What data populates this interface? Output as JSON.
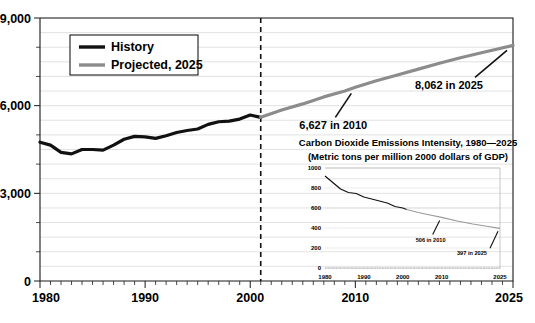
{
  "chart_data": [
    {
      "id": "main",
      "type": "line",
      "title": "",
      "xlabel": "",
      "ylabel": "",
      "xlim": [
        1980,
        2025
      ],
      "ylim": [
        0,
        9000
      ],
      "yticks": [
        0,
        3000,
        6000,
        9000
      ],
      "ytick_labels": [
        "0",
        "3,000",
        "6,000",
        "9,000"
      ],
      "ytick_minor_step": 1000,
      "xticks": [
        1980,
        1990,
        2000,
        2010,
        2025
      ],
      "xtick_labels": [
        "1980",
        "1990",
        "2000",
        "2010",
        "2025"
      ],
      "grid": true,
      "legend_position": "upper-left",
      "divider_year": 2001,
      "series": [
        {
          "name": "History",
          "color": "#111111",
          "x": [
            1980,
            1981,
            1982,
            1983,
            1984,
            1985,
            1986,
            1987,
            1988,
            1989,
            1990,
            1991,
            1992,
            1993,
            1994,
            1995,
            1996,
            1997,
            1998,
            1999,
            2000,
            2001
          ],
          "values": [
            4750,
            4650,
            4400,
            4350,
            4500,
            4500,
            4480,
            4650,
            4850,
            4950,
            4930,
            4880,
            4970,
            5080,
            5150,
            5200,
            5360,
            5450,
            5470,
            5540,
            5680,
            5600
          ]
        },
        {
          "name": "Projected, 2025",
          "color": "#8c8c8c",
          "x": [
            2001,
            2003,
            2005,
            2007,
            2009,
            2010,
            2012,
            2014,
            2016,
            2018,
            2020,
            2022,
            2025
          ],
          "values": [
            5600,
            5850,
            6060,
            6300,
            6500,
            6627,
            6850,
            7050,
            7250,
            7450,
            7640,
            7810,
            8062
          ]
        }
      ],
      "annotations": [
        {
          "text": "6,627 in 2010",
          "value": 6627,
          "year": 2010
        },
        {
          "text": "8,062 in 2025",
          "value": 8062,
          "year": 2025
        }
      ]
    },
    {
      "id": "inset",
      "type": "line",
      "title": "Carbon Dioxide Emissions Intensity, 1980—2025",
      "subtitle": "(Metric tons per million 2000 dollars of GDP)",
      "xlabel": "",
      "ylabel": "",
      "xlim": [
        1980,
        2025
      ],
      "ylim": [
        0,
        1000
      ],
      "yticks": [
        0,
        200,
        400,
        600,
        800,
        1000
      ],
      "ytick_labels": [
        "0",
        "200",
        "400",
        "600",
        "800",
        "1000"
      ],
      "xticks": [
        1980,
        1990,
        2000,
        2010,
        2025
      ],
      "xtick_labels": [
        "1980",
        "1990",
        "2000",
        "2010",
        "2025"
      ],
      "grid": true,
      "divider_year": 2001,
      "series": [
        {
          "name": "History",
          "color": "#111111",
          "x": [
            1980,
            1982,
            1984,
            1986,
            1988,
            1990,
            1992,
            1994,
            1996,
            1998,
            2000,
            2001
          ],
          "values": [
            920,
            855,
            790,
            755,
            745,
            710,
            690,
            670,
            650,
            615,
            600,
            585
          ]
        },
        {
          "name": "Projected, 2025",
          "color": "#9a9a9a",
          "x": [
            2001,
            2004,
            2007,
            2010,
            2014,
            2018,
            2022,
            2025
          ],
          "values": [
            585,
            555,
            530,
            506,
            470,
            440,
            415,
            397
          ]
        }
      ],
      "annotations": [
        {
          "text": "506 in 2010",
          "value": 506,
          "year": 2010
        },
        {
          "text": "397 in 2025",
          "value": 397,
          "year": 2025
        }
      ]
    }
  ],
  "legend": {
    "items": [
      {
        "label": "History",
        "color": "#111111"
      },
      {
        "label": "Projected, 2025",
        "color": "#8c8c8c"
      }
    ]
  }
}
